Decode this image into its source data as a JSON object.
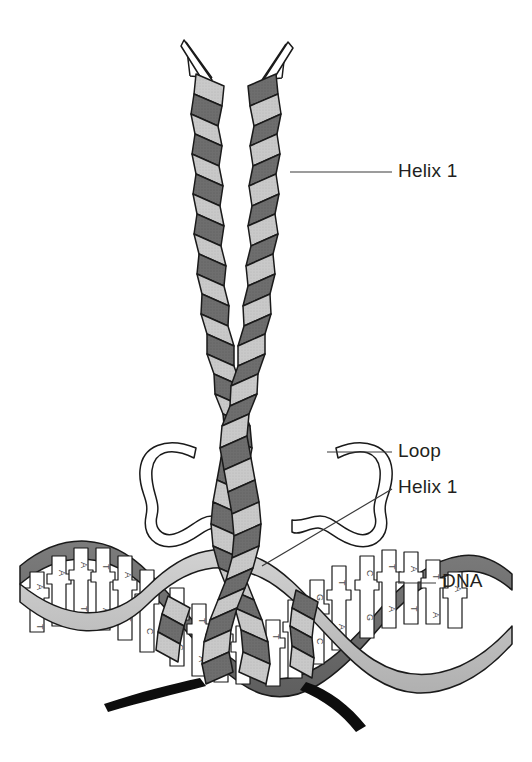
{
  "figure": {
    "background_color": "#ffffff",
    "labels": [
      {
        "id": "helix1-top",
        "text": "Helix 1",
        "x": 398,
        "y": 160
      },
      {
        "id": "loop",
        "text": "Loop",
        "x": 398,
        "y": 440
      },
      {
        "id": "helix1-bottom",
        "text": "Helix 1",
        "x": 398,
        "y": 476
      },
      {
        "id": "dna",
        "text": "DNA",
        "x": 442,
        "y": 570
      }
    ],
    "leader_lines": [
      {
        "id": "leader-helix1-top",
        "x1": 290,
        "y1": 172,
        "x2": 392,
        "y2": 172
      },
      {
        "id": "leader-loop",
        "x1": 327,
        "y1": 452,
        "x2": 392,
        "y2": 452
      },
      {
        "id": "leader-helix1-bottom",
        "x1": 262,
        "y1": 566,
        "x2": 392,
        "y2": 489
      },
      {
        "id": "leader-dna",
        "x1": 398,
        "y1": 583,
        "x2": 436,
        "y2": 583
      }
    ],
    "colors": {
      "ribbon_front": "#c9c9c9",
      "ribbon_back": "#6e6e6e",
      "dna_strand_front": "#c4c4c4",
      "dna_strand_back": "#707070",
      "base_pair_fill": "#ffffff",
      "outline": "#1a1a1a",
      "text": "#231f20",
      "tail_black": "#0d0d0d"
    },
    "dna": {
      "base_letters_left": [
        "A",
        "A",
        "T",
        "T",
        "A",
        "T"
      ],
      "base_letters_mid": [
        "G",
        "C",
        "T",
        "A",
        "A",
        "T"
      ],
      "base_letters_right": [
        "T",
        "G",
        "C",
        "G",
        "T",
        "A",
        "A",
        "T"
      ],
      "base_pair_symbol": "·"
    },
    "structure": {
      "helix_count": 4,
      "loop_count": 2,
      "terminal_tails": 2
    }
  }
}
